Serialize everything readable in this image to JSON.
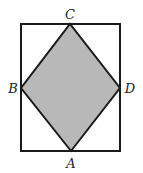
{
  "diagram": {
    "width": 143,
    "height": 173,
    "rectangle": {
      "x": 21,
      "y": 24,
      "width": 99,
      "height": 127,
      "stroke": "#1a1a1a",
      "stroke_width": 2
    },
    "rhombus": {
      "fill": "#b8b8b8",
      "stroke": "#1a1a1a",
      "stroke_width": 2,
      "vertices": {
        "A": [
          71,
          151
        ],
        "B": [
          21,
          88
        ],
        "C": [
          70,
          24
        ],
        "D": [
          120,
          88
        ]
      }
    },
    "labels": {
      "A": "A",
      "B": "B",
      "C": "C",
      "D": "D"
    }
  }
}
